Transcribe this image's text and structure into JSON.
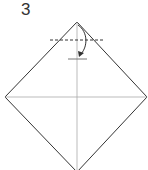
{
  "step": {
    "number": "3"
  },
  "diagram": {
    "type": "origami-fold-step",
    "shape": "square-diamond",
    "fold": "valley-fold-top-corner-down",
    "colors": {
      "outline": "#333333",
      "crease": "#999999",
      "dashed": "#333333",
      "arrow": "#333333"
    }
  }
}
